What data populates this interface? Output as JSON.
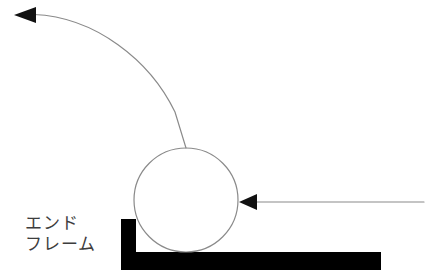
{
  "diagram": {
    "title": "",
    "background_color": "#ffffff",
    "labels": [
      {
        "name": "end-frame-label",
        "line1": "エンド",
        "line2": "フレーム",
        "text": "エンドフレーム",
        "color": "#3d3d3d",
        "x": 25,
        "y": 213
      }
    ],
    "shapes": {
      "end_frame_bracket": {
        "icon": "l-bracket-shape",
        "color": "#000000",
        "vertical_leg": {
          "x": 121,
          "y": 219,
          "width": 15,
          "height": 51
        },
        "horizontal_leg": {
          "x": 121,
          "y": 252,
          "width": 260,
          "height": 18
        }
      },
      "roller_circle": {
        "icon": "circle-outline",
        "cx": 186,
        "cy": 200,
        "r": 52,
        "stroke": "#8a8a8a",
        "stroke_width": 1.2,
        "fill": "none"
      }
    },
    "arrows": [
      {
        "name": "curved-arrow-up-left",
        "icon": "curved-arrow-icon",
        "direction": "up-left",
        "stroke": "#8a8a8a",
        "stroke_width": 1.2,
        "head_fill": "#111111",
        "tip": {
          "x": 14,
          "y": 15
        },
        "tail": {
          "x": 186,
          "y": 148
        },
        "path": "M 34 14.5 C 95 17 150 60 175 112 L 186 148",
        "head_points": "14,15 36,7 36,23"
      },
      {
        "name": "straight-arrow-left",
        "icon": "straight-arrow-icon",
        "direction": "left",
        "stroke": "#8a8a8a",
        "stroke_width": 1.2,
        "head_fill": "#111111",
        "tip": {
          "x": 239,
          "y": 202
        },
        "tail": {
          "x": 424,
          "y": 202
        },
        "path": "M 256 202 L 424 202",
        "head_points": "239,202 257,194 257,210"
      }
    ]
  }
}
